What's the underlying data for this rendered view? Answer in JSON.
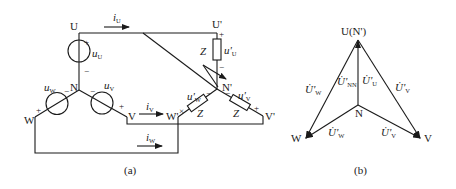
{
  "figure_a": {
    "caption": "(a)",
    "nodes": {
      "U": "U",
      "N": "N",
      "V": "V",
      "W": "W",
      "U_prime": "U'",
      "N_prime": "N'",
      "V_prime": "V'",
      "W_prime": "W'"
    },
    "sources": {
      "u_U": {
        "sym": "u",
        "sub": "U",
        "plus": "+",
        "minus": "−"
      },
      "u_V": {
        "sym": "u",
        "sub": "V",
        "plus": "+",
        "minus": "−"
      },
      "u_W": {
        "sym": "u",
        "sub": "W",
        "plus": "+",
        "minus": "−"
      }
    },
    "currents": {
      "i_U": {
        "sym": "i",
        "sub": "U"
      },
      "i_V": {
        "sym": "i",
        "sub": "V"
      },
      "i_W": {
        "sym": "i",
        "sub": "W"
      }
    },
    "loads": {
      "Z_U": {
        "label": "Z",
        "volt_sym": "u'",
        "volt_sub": "U",
        "plus": "+",
        "minus": "−"
      },
      "Z_V": {
        "label": "Z",
        "volt_sym": "u'",
        "volt_sub": "V",
        "plus": "+",
        "minus": "−"
      },
      "Z_W": {
        "label": "Z",
        "volt_sym": "u'",
        "volt_sub": "W",
        "plus": "×",
        "minus": "−"
      }
    }
  },
  "figure_b": {
    "caption": "(b)",
    "nodes": {
      "top": "U(N')",
      "center": "N",
      "left": "W",
      "right": "V"
    },
    "phasors": {
      "U_W_outer": {
        "sym": "U̇'",
        "sub": "W"
      },
      "U_NN": {
        "sym": "U̇'",
        "sub": "NN"
      },
      "U_U": {
        "sym": "U̇'",
        "sub": "U"
      },
      "U_V_outer": {
        "sym": "U̇'",
        "sub": "V"
      },
      "U_W_inner": {
        "sym": "U̇'",
        "sub": "W"
      },
      "U_V_inner": {
        "sym": "U̇'",
        "sub": "V"
      }
    }
  }
}
